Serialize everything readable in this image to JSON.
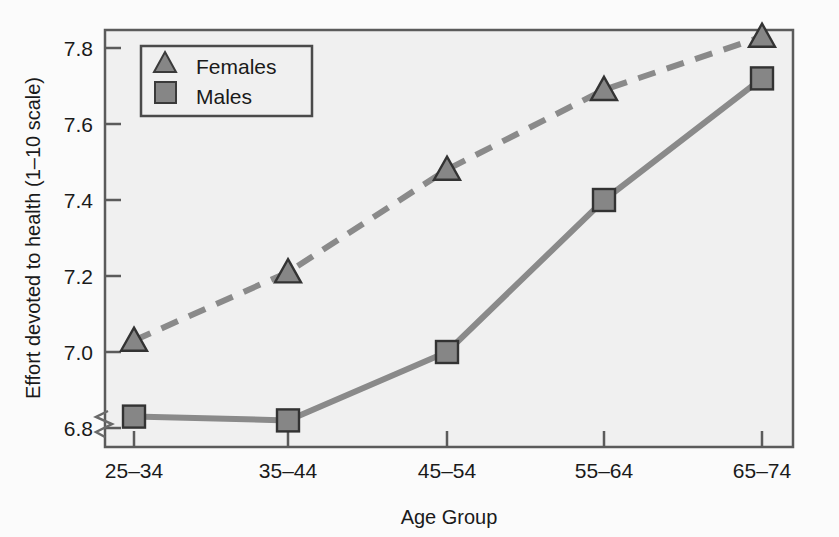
{
  "chart_data": {
    "type": "line",
    "title": "",
    "xlabel": "Age Group",
    "ylabel": "Effort devoted to health (1–10 scale)",
    "categories": [
      "25–34",
      "35–44",
      "45–54",
      "55–64",
      "65–74"
    ],
    "series": [
      {
        "name": "Females",
        "marker": "triangle",
        "linestyle": "dashed",
        "color": "#808080",
        "values": [
          7.03,
          7.21,
          7.48,
          7.69,
          7.83
        ]
      },
      {
        "name": "Males",
        "marker": "square",
        "linestyle": "solid",
        "color": "#808080",
        "values": [
          6.83,
          6.82,
          7.0,
          7.4,
          7.72
        ]
      }
    ],
    "ylim": [
      6.73,
      7.87
    ],
    "yticks": [
      6.8,
      7.0,
      7.2,
      7.4,
      7.6,
      7.8
    ],
    "ytick_labels": [
      "6.8",
      "7.0",
      "7.2",
      "7.4",
      "7.6",
      "7.8"
    ],
    "grid": false,
    "y_axis_break": true,
    "legend_position": "top-left",
    "plot_background": "#f0f0f0",
    "frame_color": "#555555"
  },
  "legend": {
    "entries": [
      {
        "label": "Females",
        "marker": "triangle-marker"
      },
      {
        "label": "Males",
        "marker": "square-marker"
      }
    ]
  },
  "axes": {
    "y_title": "Effort devoted to health (1–10 scale)",
    "x_title": "Age Group",
    "y_tick_labels": [
      "7.8",
      "7.6",
      "7.4",
      "7.2",
      "7.0",
      "6.8"
    ],
    "x_tick_labels": [
      "25–34",
      "35–44",
      "45–54",
      "55–64",
      "65–74"
    ]
  }
}
